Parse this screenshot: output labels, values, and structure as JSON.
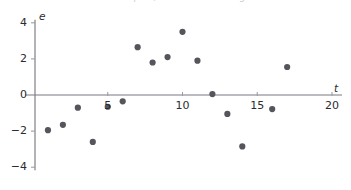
{
  "figure": {
    "caption_sliver": "residual plot, cut off above figure"
  },
  "chart_data": {
    "type": "scatter",
    "title": "",
    "xlabel": "t",
    "ylabel": "e",
    "xlim": [
      0,
      20
    ],
    "ylim": [
      -4,
      4
    ],
    "xticks": [
      5,
      10,
      15,
      20
    ],
    "yticks": [
      -4,
      -2,
      0,
      2,
      4
    ],
    "xtick_labels": [
      "5",
      "10",
      "15",
      "20"
    ],
    "ytick_labels": [
      "−4",
      "−2",
      "0",
      "2",
      "4"
    ],
    "grid": false,
    "legend": null,
    "zero_line": true,
    "marker": {
      "shape": "circle",
      "size": 3.1,
      "color": "#55555c"
    },
    "series": [
      {
        "name": "residuals",
        "points": [
          {
            "t": 1,
            "e": -1.95
          },
          {
            "t": 2,
            "e": -1.65
          },
          {
            "t": 3,
            "e": -0.7
          },
          {
            "t": 4,
            "e": -2.6
          },
          {
            "t": 5,
            "e": -0.65
          },
          {
            "t": 6,
            "e": -0.35
          },
          {
            "t": 7,
            "e": 2.65
          },
          {
            "t": 8,
            "e": 1.8
          },
          {
            "t": 9,
            "e": 2.1
          },
          {
            "t": 10,
            "e": 3.5
          },
          {
            "t": 11,
            "e": 1.9
          },
          {
            "t": 12,
            "e": 0.05
          },
          {
            "t": 13,
            "e": -1.05
          },
          {
            "t": 14,
            "e": -2.85
          },
          {
            "t": 16,
            "e": -0.78
          },
          {
            "t": 17,
            "e": 1.55
          }
        ]
      }
    ]
  }
}
